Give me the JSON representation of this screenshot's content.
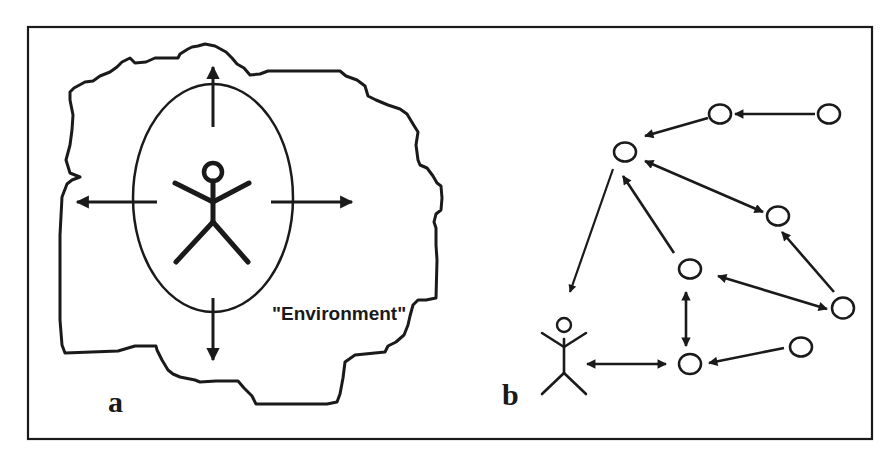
{
  "figure": {
    "panels": [
      {
        "id": "a",
        "label": "a",
        "environment_label": "\"Environment\"",
        "description": "Single actor inside an ellipse, surrounded by an irregular environment boundary, with four outward arrows (up, down, left, right)."
      },
      {
        "id": "b",
        "label": "b",
        "description": "Actor connected within a network of nodes linked by directed and bidirectional arrows."
      }
    ],
    "colors": {
      "ink": "#1a1a1a",
      "background": "#ffffff"
    },
    "network": {
      "nodes": [
        {
          "id": "n1",
          "x": 625,
          "y": 152
        },
        {
          "id": "n2",
          "x": 720,
          "y": 114
        },
        {
          "id": "n3",
          "x": 829,
          "y": 114
        },
        {
          "id": "n4",
          "x": 778,
          "y": 216
        },
        {
          "id": "n5",
          "x": 690,
          "y": 269
        },
        {
          "id": "n6",
          "x": 843,
          "y": 308
        },
        {
          "id": "n7",
          "x": 690,
          "y": 364
        },
        {
          "id": "n8",
          "x": 801,
          "y": 347
        }
      ],
      "edges": [
        {
          "from": "n3",
          "to": "n2",
          "type": "directed"
        },
        {
          "from": "n2",
          "to": "n1",
          "type": "directed"
        },
        {
          "from": "n1",
          "to": "n4",
          "type": "bidirectional"
        },
        {
          "from": "n5",
          "to": "n1",
          "type": "directed"
        },
        {
          "from": "n1",
          "to": "actor",
          "type": "directed"
        },
        {
          "from": "n6",
          "to": "n4",
          "type": "directed"
        },
        {
          "from": "n5",
          "to": "n6",
          "type": "bidirectional"
        },
        {
          "from": "n5",
          "to": "n7",
          "type": "bidirectional"
        },
        {
          "from": "n8",
          "to": "n7",
          "type": "directed"
        },
        {
          "from": "actor",
          "to": "n7",
          "type": "bidirectional"
        }
      ]
    }
  }
}
